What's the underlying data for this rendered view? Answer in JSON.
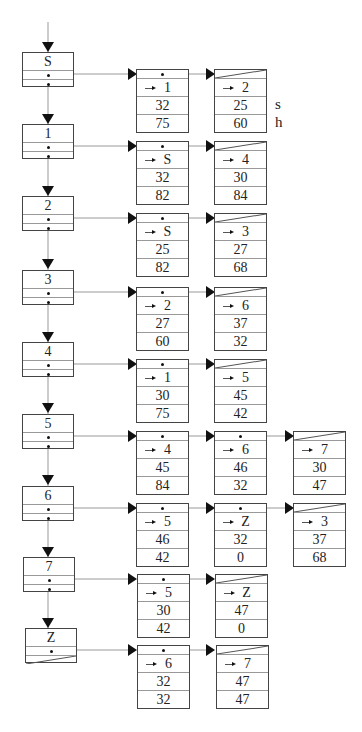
{
  "diagram": {
    "type": "adjacency-list",
    "side_labels": [
      "s",
      "h"
    ],
    "vertices": [
      {
        "label": "S",
        "edges": [
          {
            "to": "1",
            "s": "32",
            "h": "75"
          },
          {
            "to": "2",
            "s": "25",
            "h": "60"
          }
        ]
      },
      {
        "label": "1",
        "edges": [
          {
            "to": "S",
            "s": "32",
            "h": "82"
          },
          {
            "to": "4",
            "s": "30",
            "h": "84"
          }
        ]
      },
      {
        "label": "2",
        "edges": [
          {
            "to": "S",
            "s": "25",
            "h": "82"
          },
          {
            "to": "3",
            "s": "27",
            "h": "68"
          }
        ]
      },
      {
        "label": "3",
        "edges": [
          {
            "to": "2",
            "s": "27",
            "h": "60"
          },
          {
            "to": "6",
            "s": "37",
            "h": "32"
          }
        ]
      },
      {
        "label": "4",
        "edges": [
          {
            "to": "1",
            "s": "30",
            "h": "75"
          },
          {
            "to": "5",
            "s": "45",
            "h": "42"
          }
        ]
      },
      {
        "label": "5",
        "edges": [
          {
            "to": "4",
            "s": "45",
            "h": "84"
          },
          {
            "to": "6",
            "s": "46",
            "h": "32"
          },
          {
            "to": "7",
            "s": "30",
            "h": "47"
          }
        ]
      },
      {
        "label": "6",
        "edges": [
          {
            "to": "5",
            "s": "46",
            "h": "42"
          },
          {
            "to": "Z",
            "s": "32",
            "h": "0"
          },
          {
            "to": "3",
            "s": "37",
            "h": "68"
          }
        ]
      },
      {
        "label": "7",
        "edges": [
          {
            "to": "5",
            "s": "30",
            "h": "42"
          },
          {
            "to": "Z",
            "s": "47",
            "h": "0"
          }
        ]
      },
      {
        "label": "Z",
        "edges": [
          {
            "to": "6",
            "s": "32",
            "h": "32"
          },
          {
            "to": "7",
            "s": "47",
            "h": "47"
          }
        ]
      }
    ]
  }
}
